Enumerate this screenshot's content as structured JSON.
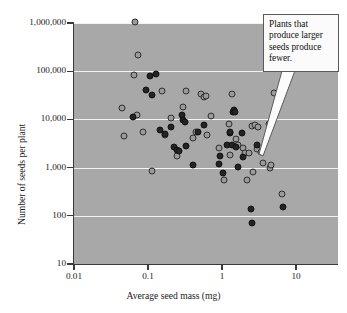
{
  "chart_data": {
    "type": "scatter",
    "title": "",
    "xlabel": "Average seed mass (mg)",
    "ylabel": "Number of seeds per plant",
    "xscale": "log",
    "yscale": "log",
    "xlim": [
      0.01,
      20
    ],
    "ylim": [
      10,
      2000000
    ],
    "grid": true,
    "legend": false,
    "xticks": [
      "0.01",
      "0.1",
      "1",
      "10"
    ],
    "xtick_values": [
      0.01,
      0.1,
      1,
      10
    ],
    "yticks": [
      "10",
      "100",
      "1,000",
      "10,000",
      "100,000",
      "1,000,000"
    ],
    "ytick_values": [
      10,
      100,
      1000,
      10000,
      100000,
      1000000
    ],
    "annotations": [
      {
        "text": "Plants that produce larger seeds produce fewer.",
        "line1": "Plants that",
        "line2": "produce larger",
        "line3": "seeds produce",
        "line4": "fewer."
      }
    ],
    "series": [
      {
        "name": "open-marker",
        "style": "open-circle",
        "points": [
          [
            0.044,
            17000
          ],
          [
            0.047,
            4600
          ],
          [
            0.066,
            1050000
          ],
          [
            0.065,
            85000
          ],
          [
            0.072,
            12500
          ],
          [
            0.085,
            5400
          ],
          [
            0.115,
            870
          ],
          [
            0.155,
            38000
          ],
          [
            0.17,
            4800
          ],
          [
            0.205,
            10500
          ],
          [
            0.25,
            1750
          ],
          [
            0.3,
            18500
          ],
          [
            0.33,
            38000
          ],
          [
            0.4,
            4100
          ],
          [
            0.44,
            5600
          ],
          [
            0.52,
            34000
          ],
          [
            0.57,
            29000
          ],
          [
            0.6,
            31000
          ],
          [
            0.63,
            4700
          ],
          [
            0.7,
            12000
          ],
          [
            0.92,
            2600
          ],
          [
            1.05,
            560
          ],
          [
            1.25,
            7900
          ],
          [
            1.3,
            1800
          ],
          [
            1.35,
            34000
          ],
          [
            1.55,
            4000
          ],
          [
            1.62,
            3000
          ],
          [
            1.95,
            2600
          ],
          [
            2.05,
            2050
          ],
          [
            2.15,
            560
          ],
          [
            2.35,
            2000
          ],
          [
            2.55,
            7300
          ],
          [
            2.62,
            800
          ],
          [
            2.75,
            7800
          ],
          [
            2.95,
            2450
          ],
          [
            3.05,
            7000
          ],
          [
            3.35,
            2100
          ],
          [
            3.55,
            1250
          ],
          [
            4.3,
            8000
          ],
          [
            4.5,
            960
          ],
          [
            4.55,
            1150
          ],
          [
            5.1,
            36000
          ],
          [
            6.4,
            280
          ],
          [
            0.073,
            220000
          ]
        ]
      },
      {
        "name": "filled-marker",
        "style": "filled-circle",
        "points": [
          [
            0.062,
            11200
          ],
          [
            0.093,
            41000
          ],
          [
            0.105,
            79000
          ],
          [
            0.112,
            32000
          ],
          [
            0.128,
            86000
          ],
          [
            0.145,
            6100
          ],
          [
            0.172,
            4900
          ],
          [
            0.205,
            6800
          ],
          [
            0.225,
            2700
          ],
          [
            0.245,
            2300
          ],
          [
            0.265,
            2250
          ],
          [
            0.285,
            12500
          ],
          [
            0.3,
            9600
          ],
          [
            0.315,
            8700
          ],
          [
            0.33,
            2750
          ],
          [
            0.4,
            1140
          ],
          [
            0.47,
            5400
          ],
          [
            0.58,
            7700
          ],
          [
            0.9,
            1200
          ],
          [
            0.95,
            1750
          ],
          [
            1.02,
            760
          ],
          [
            1.18,
            2950
          ],
          [
            1.28,
            5300
          ],
          [
            1.3,
            5500
          ],
          [
            1.35,
            2900
          ],
          [
            1.4,
            14000
          ],
          [
            1.45,
            15500
          ],
          [
            1.48,
            14500
          ],
          [
            1.55,
            2700
          ],
          [
            1.62,
            1050
          ],
          [
            1.85,
            5300
          ],
          [
            1.95,
            1650
          ],
          [
            2.45,
            140
          ],
          [
            2.52,
            70
          ],
          [
            3.0,
            2900
          ],
          [
            6.6,
            155
          ]
        ]
      }
    ]
  },
  "axes": {
    "x_title": "Average seed mass (mg)",
    "y_title": "Number of seeds per plant",
    "x_labels": [
      "0.01",
      "0.1",
      "1",
      "10"
    ],
    "y_labels": [
      "1,000,000",
      "100,000",
      "10,000",
      "1,000",
      "100",
      "10"
    ]
  },
  "callout": {
    "text": "Plants that produce larger seeds produce fewer."
  },
  "colors": {
    "plot_background": "#a8a8a8",
    "gridline": "#f2f2f2",
    "axis": "#3a3a3a",
    "open_marker_fill": "#9a9a9a",
    "open_marker_edge": "#2e2e2e",
    "filled_marker": "#242424",
    "callout_background": "#fbfbfb",
    "callout_border": "#5a5a5a",
    "page_background": "#ffffff"
  }
}
